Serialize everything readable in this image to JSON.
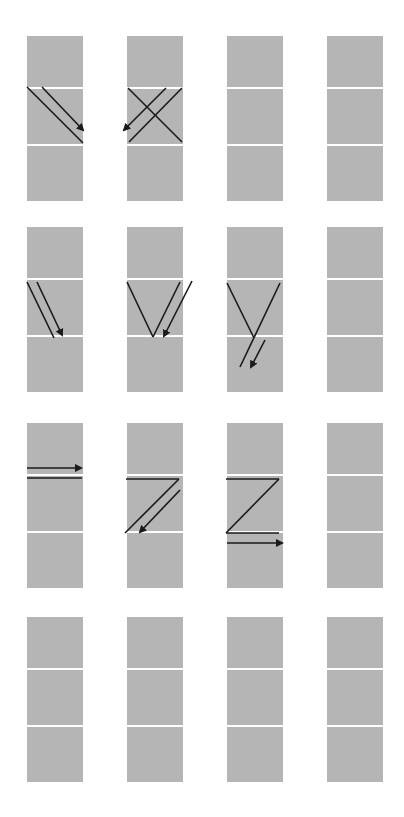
{
  "canvas": {
    "width": 404,
    "height": 817,
    "background": "#ffffff"
  },
  "colors": {
    "panel_fill": "#b5b5b5",
    "separator": "#ffffff",
    "stroke": "#1a1a1a"
  },
  "grid": {
    "columns_x": [
      27,
      127,
      227,
      327
    ],
    "rows_y": [
      36,
      227,
      423,
      617
    ],
    "cell_width": 56,
    "cell_heights": [
      51,
      55,
      55
    ],
    "separator_gap": 2
  },
  "panels": [
    {
      "id": "r1c1",
      "row": 0,
      "col": 0,
      "lines": [
        [
          27,
          87,
          83,
          143
        ]
      ],
      "arrows": [
        [
          42,
          87,
          83,
          130
        ]
      ]
    },
    {
      "id": "r1c2",
      "row": 0,
      "col": 1,
      "lines": [
        [
          128,
          88,
          182,
          142
        ],
        [
          182,
          88,
          129,
          142
        ]
      ],
      "arrows": [
        [
          166,
          88,
          124,
          130
        ]
      ]
    },
    {
      "id": "r1c3",
      "row": 0,
      "col": 2,
      "lines": [],
      "arrows": []
    },
    {
      "id": "r1c4",
      "row": 0,
      "col": 3,
      "lines": [],
      "arrows": []
    },
    {
      "id": "r2c1",
      "row": 1,
      "col": 0,
      "lines": [
        [
          27,
          282,
          54,
          338
        ]
      ],
      "arrows": [
        [
          37,
          282,
          62,
          335
        ]
      ]
    },
    {
      "id": "r2c2",
      "row": 1,
      "col": 1,
      "lines": [
        [
          127,
          282,
          153,
          337
        ],
        [
          153,
          337,
          180,
          282
        ]
      ],
      "arrows": [
        [
          192,
          281,
          164,
          336
        ]
      ]
    },
    {
      "id": "r2c3",
      "row": 1,
      "col": 2,
      "lines": [
        [
          227,
          283,
          254,
          338
        ],
        [
          280,
          283,
          240,
          367
        ]
      ],
      "arrows": [
        [
          265,
          340,
          251,
          367
        ]
      ]
    },
    {
      "id": "r2c4",
      "row": 1,
      "col": 3,
      "lines": [],
      "arrows": []
    },
    {
      "id": "r3c1",
      "row": 2,
      "col": 0,
      "lines": [
        [
          27,
          478,
          82,
          478
        ]
      ],
      "arrows": [
        [
          27,
          468,
          81,
          468
        ]
      ]
    },
    {
      "id": "r3c2",
      "row": 2,
      "col": 1,
      "lines": [
        [
          126,
          479,
          179,
          479
        ],
        [
          179,
          479,
          125,
          533
        ]
      ],
      "arrows": [
        [
          180,
          490,
          140,
          532
        ]
      ]
    },
    {
      "id": "r3c3",
      "row": 2,
      "col": 2,
      "lines": [
        [
          226,
          479,
          279,
          479
        ],
        [
          279,
          479,
          226,
          533
        ],
        [
          226,
          533,
          279,
          533
        ]
      ],
      "arrows": [
        [
          227,
          543,
          282,
          543
        ]
      ]
    },
    {
      "id": "r3c4",
      "row": 2,
      "col": 3,
      "lines": [],
      "arrows": []
    },
    {
      "id": "r4c1",
      "row": 3,
      "col": 0,
      "lines": [],
      "arrows": []
    },
    {
      "id": "r4c2",
      "row": 3,
      "col": 1,
      "lines": [],
      "arrows": []
    },
    {
      "id": "r4c3",
      "row": 3,
      "col": 2,
      "lines": [],
      "arrows": []
    },
    {
      "id": "r4c4",
      "row": 3,
      "col": 3,
      "lines": [],
      "arrows": []
    }
  ]
}
